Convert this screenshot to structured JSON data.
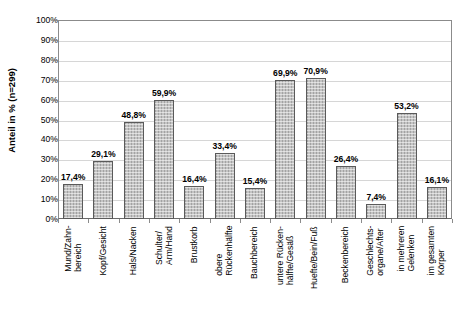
{
  "chart_data": {
    "type": "bar",
    "title": "",
    "subtitle": "",
    "xlabel": "",
    "ylabel": "Anteil in % (n=299)",
    "ylim": [
      0,
      100
    ],
    "yticks": [
      "0%",
      "10%",
      "20%",
      "30%",
      "40%",
      "50%",
      "60%",
      "70%",
      "80%",
      "90%",
      "100%"
    ],
    "ytick_values": [
      0,
      10,
      20,
      30,
      40,
      50,
      60,
      70,
      80,
      90,
      100
    ],
    "grid": true,
    "legend": "none",
    "n": 299,
    "categories": [
      "Mund/Zahn-\nbereich",
      "Kopf/Gesicht",
      "Hals/Nacken",
      "Schulter/\nArm/Hand",
      "Brustkorb",
      "obere\nRückenhälfte",
      "Bauchbereich",
      "untere Rücken-\nhälfte/Gesäß",
      "Huefte/Bein/Fuß",
      "Beckenbereich",
      "Geschlechts-\norgane/After",
      "in mehreren\nGelenken",
      "im gesamten\nKörper"
    ],
    "values": [
      17.4,
      29.1,
      48.8,
      59.9,
      16.4,
      33.4,
      15.4,
      69.9,
      70.9,
      26.4,
      7.4,
      53.2,
      16.1
    ],
    "value_labels": [
      "17,4%",
      "29,1%",
      "48,8%",
      "59,9%",
      "16,4%",
      "33,4%",
      "15,4%",
      "69,9%",
      "70,9%",
      "26,4%",
      "7,4%",
      "53,2%",
      "16,1%"
    ],
    "colors": {
      "bar_fill": "#c4c4c4",
      "bar_border": "#5a5a5a",
      "gridline": "#d6d6d6",
      "axis": "#8b8b8b",
      "text": "#000000",
      "background": "#ffffff"
    }
  }
}
